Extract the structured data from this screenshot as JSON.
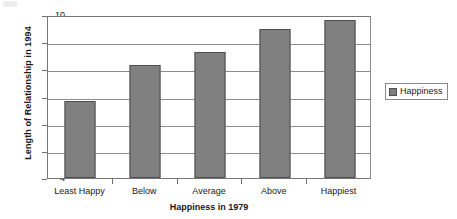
{
  "chart_data": {
    "type": "bar",
    "title": "",
    "subtitle": "",
    "xlabel": "Happiness in 1979",
    "ylabel": "Length of Relationship in 1994",
    "categories": [
      "Least Happy",
      "Below",
      "Average",
      "Above",
      "Happiest"
    ],
    "series": [
      {
        "name": "Happiness",
        "values": [
          6.85,
          8.15,
          8.65,
          9.5,
          9.8
        ],
        "color": "#808080"
      }
    ],
    "values": [
      6.85,
      8.15,
      8.65,
      9.5,
      9.8
    ],
    "ylim": [
      4,
      10
    ],
    "y_ticks": [
      4,
      5,
      6,
      7,
      8,
      9,
      10
    ],
    "y_tick_labels": [
      "4",
      "5",
      "6",
      "7",
      "8",
      "9",
      "10"
    ],
    "grid": true,
    "grid_axis": "y",
    "legend": {
      "position": "right",
      "entries": [
        "Happiness"
      ],
      "boxed": true
    },
    "annotations": []
  },
  "legend": {
    "label": "Happiness",
    "swatch_color": "#808080"
  },
  "axes": {
    "y_title": "Length of Relationship in 1994",
    "x_title": "Happiness in 1979"
  },
  "colors": {
    "bar_fill": "#808080",
    "bar_border": "#4f4f4f",
    "gridline": "#8d8d8d",
    "frame": "#777777",
    "background": "#ffffff",
    "text": "#1a1a1a"
  }
}
